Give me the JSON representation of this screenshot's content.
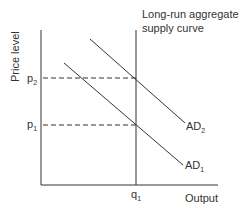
{
  "diagram": {
    "title_line1": "Long-run aggregate",
    "title_line2": "supply curve",
    "y_axis_label": "Price level",
    "x_axis_label": "Output",
    "price_labels": {
      "p2": "p",
      "p2_sub": "2",
      "p1": "p",
      "p1_sub": "1"
    },
    "quantity_label": {
      "q": "q",
      "q_sub": "1"
    },
    "curves": {
      "ad2": {
        "label": "AD",
        "sub": "2"
      },
      "ad1": {
        "label": "AD",
        "sub": "1"
      }
    },
    "colors": {
      "line": "#333333",
      "background": "#ffffff"
    }
  }
}
